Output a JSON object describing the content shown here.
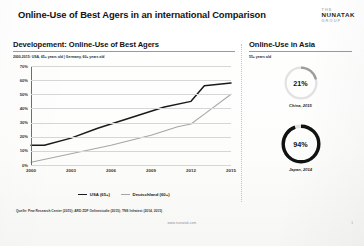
{
  "header": {
    "title": "Online-Use of Best Agers in an international Comparison",
    "logo": {
      "line1": "THE",
      "line2": "NUNATAK",
      "line3": "GROUP"
    }
  },
  "left_panel": {
    "title": "Developement: Online-Use of Best Agers",
    "subtitle": "2000-2015: USA, 65+ years old | Germany, 60+ years old"
  },
  "right_panel": {
    "title": "Online-Use in Asia",
    "subtitle": "55+ years old",
    "donuts": [
      {
        "value_label": "21%",
        "value": 21,
        "caption": "China, 2015",
        "color": "#9c9c9c",
        "thickness": 2.2
      },
      {
        "value_label": "94%",
        "value": 94,
        "caption": "Japan, 2014",
        "color": "#111111",
        "thickness": 3.4
      }
    ]
  },
  "footer": {
    "source": "Quelle: Pew Research Center (2015); ARD ZDF Onlinestudie (2015); TNS Infratest (2014, 2015)",
    "website": "www.nunatak.com",
    "page": "1"
  },
  "chart_data": {
    "type": "line",
    "title": "Developement: Online-Use of Best Agers",
    "subtitle": "2000-2015: USA, 65+ years old | Germany, 60+ years old",
    "xlabel": "",
    "ylabel": "",
    "x": [
      2000,
      2003,
      2006,
      2009,
      2012,
      2015
    ],
    "xticks": [
      "2000",
      "2003",
      "2006",
      "2009",
      "2012",
      "2015"
    ],
    "yticks": [
      "0%",
      "10%",
      "20%",
      "30%",
      "40%",
      "50%",
      "60%",
      "70%"
    ],
    "ylim": [
      0,
      70
    ],
    "xlim": [
      2000,
      2015
    ],
    "grid": true,
    "legend_position": "bottom-center",
    "series": [
      {
        "name": "USA (65+)",
        "color": "#1a1a1a",
        "x": [
          2000,
          2001,
          2003,
          2005,
          2006,
          2008,
          2010,
          2012,
          2013,
          2015
        ],
        "values": [
          14,
          14,
          19,
          26,
          29,
          35,
          41,
          45,
          56,
          58
        ]
      },
      {
        "name": "Deutschland (60+)",
        "color": "#a6a6a6",
        "x": [
          2000,
          2003,
          2006,
          2009,
          2011,
          2012,
          2013,
          2015
        ],
        "values": [
          2,
          8,
          14,
          21,
          27,
          29,
          36,
          50
        ]
      }
    ]
  }
}
